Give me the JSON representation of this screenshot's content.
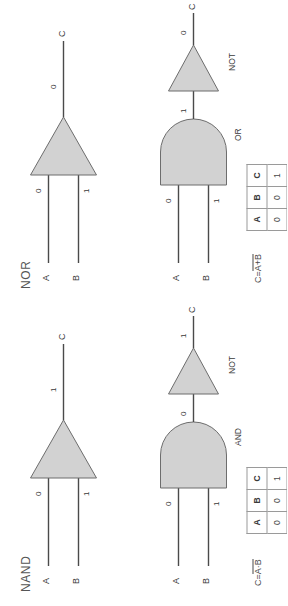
{
  "page": {
    "background": "#ffffff",
    "gate_fill": "#d2d2d2",
    "line_color": "#4a4a4a"
  },
  "sections": [
    {
      "key": "nand",
      "title": "NAND",
      "equation": {
        "lhs": "C=",
        "rhs_overbar": "A·B"
      },
      "symbol_diagram": {
        "inputs": [
          {
            "label": "A",
            "value": "0"
          },
          {
            "label": "B",
            "value": "1"
          }
        ],
        "output": {
          "label": "C",
          "value": "1"
        },
        "gate_label": ""
      },
      "equivalent_diagram": {
        "inputs": [
          {
            "label": "A",
            "value": "0"
          },
          {
            "label": "B",
            "value": "1"
          }
        ],
        "gate1_label": "AND",
        "intermediate_value": "0",
        "gate2_label": "NOT",
        "output": {
          "label": "C",
          "value": "1"
        }
      },
      "truth_table": {
        "headers": [
          "A",
          "B",
          "C"
        ],
        "rows": [
          [
            "0",
            "0",
            "1"
          ],
          [
            "0",
            "1",
            "1"
          ],
          [
            "1",
            "1",
            "0"
          ],
          [
            "1",
            "0",
            "1"
          ]
        ]
      }
    },
    {
      "key": "nor",
      "title": "NOR",
      "equation": {
        "lhs": "C=",
        "rhs_overbar": "A+B"
      },
      "symbol_diagram": {
        "inputs": [
          {
            "label": "A",
            "value": "0"
          },
          {
            "label": "B",
            "value": "1"
          }
        ],
        "output": {
          "label": "C",
          "value": "0"
        },
        "gate_label": ""
      },
      "equivalent_diagram": {
        "inputs": [
          {
            "label": "A",
            "value": "0"
          },
          {
            "label": "B",
            "value": "1"
          }
        ],
        "gate1_label": "OR",
        "intermediate_value": "1",
        "gate2_label": "NOT",
        "output": {
          "label": "C",
          "value": "0"
        }
      },
      "truth_table": {
        "headers": [
          "A",
          "B",
          "C"
        ],
        "rows": [
          [
            "0",
            "0",
            "1"
          ],
          [
            "0",
            "1",
            "0"
          ],
          [
            "1",
            "1",
            "0"
          ],
          [
            "1",
            "0",
            "0"
          ]
        ]
      }
    }
  ]
}
